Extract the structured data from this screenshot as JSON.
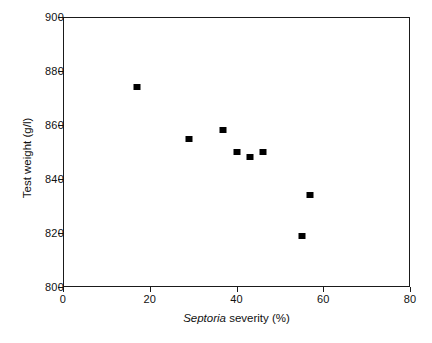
{
  "chart_data": {
    "type": "scatter",
    "title": "",
    "xlabel": "Septoria severity (%)",
    "xlabel_italic_part": "Septoria",
    "xlabel_plain_part": " severity (%)",
    "ylabel": "Test weight (g/l)",
    "xlim": [
      0,
      80
    ],
    "ylim": [
      800,
      900
    ],
    "xticks": [
      0,
      20,
      40,
      60,
      80
    ],
    "yticks": [
      800,
      820,
      840,
      860,
      880,
      900
    ],
    "xtick_labels": [
      "0",
      "20",
      "40",
      "60",
      "80"
    ],
    "ytick_labels": [
      "800",
      "820",
      "840",
      "860",
      "880",
      "900"
    ],
    "grid": false,
    "legend": false,
    "marker": "square",
    "marker_color": "#000000",
    "x": [
      17,
      29,
      37,
      40,
      43,
      46,
      55,
      57
    ],
    "y": [
      874,
      855,
      858,
      850,
      848,
      850,
      819,
      834
    ],
    "points": [
      {
        "x": 17,
        "y": 874
      },
      {
        "x": 29,
        "y": 855
      },
      {
        "x": 37,
        "y": 858
      },
      {
        "x": 40,
        "y": 850
      },
      {
        "x": 43,
        "y": 848
      },
      {
        "x": 46,
        "y": 850
      },
      {
        "x": 55,
        "y": 819
      },
      {
        "x": 57,
        "y": 834
      }
    ]
  },
  "colors": {
    "axis": "#1a1a1a",
    "marker": "#000000",
    "background": "#ffffff",
    "text": "#111111"
  }
}
